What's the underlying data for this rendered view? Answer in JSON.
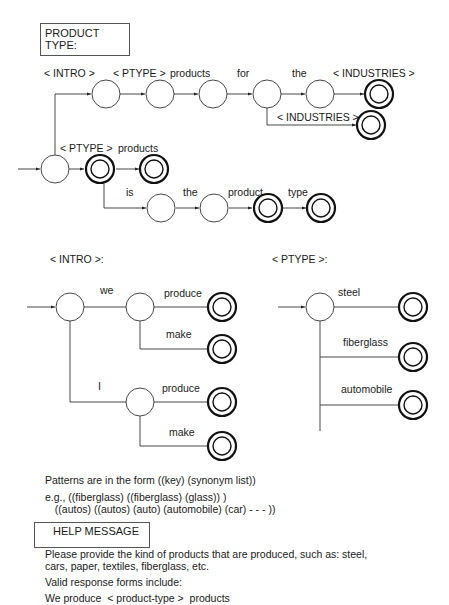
{
  "header": {
    "title": "PRODUCT TYPE:"
  },
  "main_network": {
    "labels": {
      "intro": "< INTRO >",
      "ptype_top": "< PTYPE >",
      "products_top": "products",
      "for": "for",
      "the_top": "the",
      "industries_top": "< INDUSTRIES >",
      "industries_branch": "< INDUSTRIES >",
      "ptype_mid": "< PTYPE >",
      "products_mid": "products",
      "is": "is",
      "the_bottom": "the",
      "product": "product",
      "type": "type"
    }
  },
  "intro_network": {
    "title": "< INTRO >:",
    "labels": {
      "we": "we",
      "we_produce": "produce",
      "we_make": "make",
      "i": "I",
      "i_produce": "produce",
      "i_make": "make"
    }
  },
  "ptype_network": {
    "title": "< PTYPE >:",
    "labels": {
      "steel": "steel",
      "fiberglass": "fiberglass",
      "automobile": "automobile"
    }
  },
  "patterns": {
    "line1": "Patterns are in the form ((key) (synonym list))",
    "line2": "e.g., ((fiberglass) ((fiberglass) (glass)) )",
    "line3": "  ((autos) ((autos) (auto) (automobile) (car) - - - ))"
  },
  "help": {
    "title": "HELP MESSAGE",
    "line1": "Please provide the kind of products that are produced, such as: steel,",
    "line2": "cars, paper, textiles, fiberglass, etc.",
    "line3": "Valid response forms include:",
    "line4": "We produce  < product-type >  products"
  }
}
